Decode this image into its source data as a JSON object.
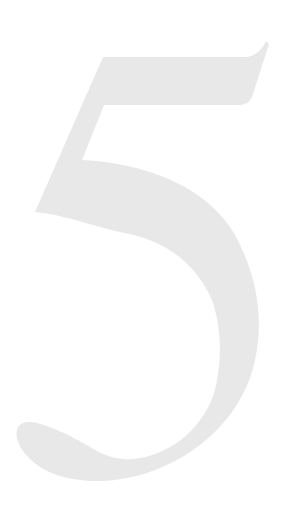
{
  "numeral": {
    "text": "5",
    "fill_color": "#e8e8e8",
    "background_color": "#ffffff"
  }
}
